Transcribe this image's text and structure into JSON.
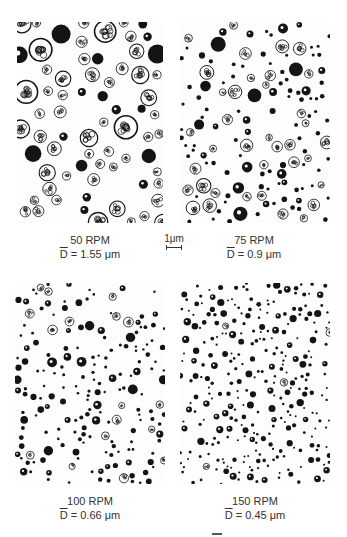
{
  "figure": {
    "panels": [
      {
        "id": "p50",
        "speed_label": "50 RPM",
        "diameter_symbol": "D",
        "diameter_value": " = 1.55 μm",
        "rmin": 4,
        "rmax": 12,
        "count": 70,
        "cellular": 0.8
      },
      {
        "id": "p75",
        "speed_label": "75 RPM",
        "diameter_symbol": "D",
        "diameter_value": " = 0.9 μm",
        "rmin": 1.5,
        "rmax": 7.5,
        "count": 140,
        "cellular": 0.5
      },
      {
        "id": "p100",
        "speed_label": "100 RPM",
        "diameter_symbol": "D",
        "diameter_value": " = 0.66 μm",
        "rmin": 1.2,
        "rmax": 5,
        "count": 190,
        "cellular": 0.3
      },
      {
        "id": "p150",
        "speed_label": "150 RPM",
        "diameter_symbol": "D",
        "diameter_value": " = 0.45 μm",
        "rmin": 1,
        "rmax": 3.8,
        "count": 300,
        "cellular": 0.15
      }
    ],
    "scale_bar": {
      "label": "1μm"
    }
  },
  "colors": {
    "particle": "#141414",
    "background": "#fdfdfd"
  }
}
